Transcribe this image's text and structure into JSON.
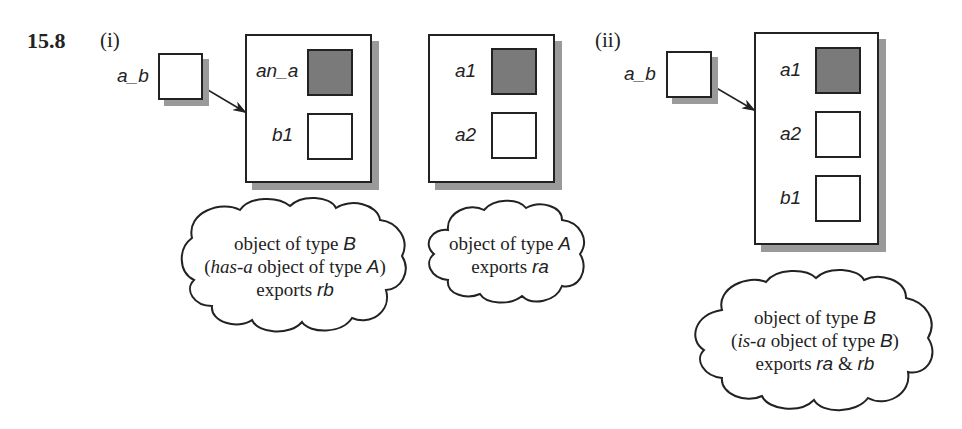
{
  "figure": {
    "number": "15.8",
    "parts": [
      {
        "label": "(i)",
        "pointer": {
          "name": "a_b"
        },
        "object": {
          "slots": [
            {
              "name": "an_a",
              "filled": true
            },
            {
              "name": "b1",
              "filled": false
            }
          ]
        },
        "cloud": {
          "line1_prefix": "object of type ",
          "line1_type": "B",
          "line2_open": "(",
          "line2_rel": "has-a",
          "line2_mid": " object of type ",
          "line2_type": "A",
          "line2_close": ")",
          "line3_prefix": "exports ",
          "line3_exports": "rb"
        }
      },
      {
        "label": "",
        "object": {
          "slots": [
            {
              "name": "a1",
              "filled": true
            },
            {
              "name": "a2",
              "filled": false
            }
          ]
        },
        "cloud": {
          "line1_prefix": "object of type ",
          "line1_type": "A",
          "line2_prefix": "exports ",
          "line2_exports": "ra"
        }
      },
      {
        "label": "(ii)",
        "pointer": {
          "name": "a_b"
        },
        "object": {
          "slots": [
            {
              "name": "a1",
              "filled": true
            },
            {
              "name": "a2",
              "filled": false
            },
            {
              "name": "b1",
              "filled": false
            }
          ]
        },
        "cloud": {
          "line1_prefix": "object of type ",
          "line1_type": "B",
          "line2_open": "(",
          "line2_rel": "is-a",
          "line2_mid": " object of type ",
          "line2_type": "B",
          "line2_close": ")",
          "line3_prefix": "exports ",
          "line3_exports_a": "ra",
          "line3_amp": " & ",
          "line3_exports_b": "rb"
        }
      }
    ]
  },
  "colors": {
    "ink": "#222222",
    "fill": "#7a7a7a",
    "shadow": "#9a9a9a"
  }
}
